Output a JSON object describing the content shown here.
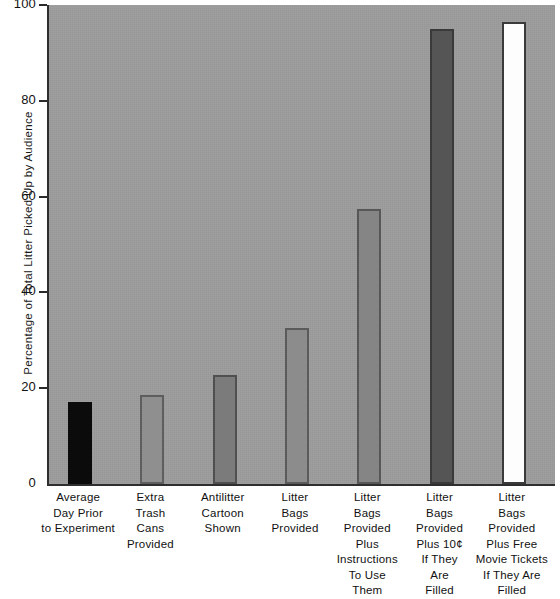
{
  "chart_data": {
    "type": "bar",
    "title": "",
    "subtitle": "",
    "xlabel": "",
    "ylabel": "Percentage of Total Litter Picked Up by Audience",
    "ylim": [
      0,
      100
    ],
    "yticks": [
      0,
      20,
      40,
      60,
      80,
      100
    ],
    "ytick_labels": [
      "0",
      "20",
      "40",
      "60",
      "80",
      "100"
    ],
    "grid": false,
    "legend": "none",
    "categories": [
      "Average Day Prior to Experiment",
      "Extra Trash Cans Provided",
      "Antilitter Cartoon Shown",
      "Litter Bags Provided",
      "Litter Bags Provided Plus Instructions To Use Them",
      "Litter Bags Provided Plus 10¢ If They Are Filled",
      "Litter Bags Provided Plus Free Movie Tickets If They Are Filled"
    ],
    "category_label_lines": [
      [
        "Average",
        "Day Prior",
        "to Experiment"
      ],
      [
        "Extra",
        "Trash",
        "Cans",
        "Provided"
      ],
      [
        "Antilitter",
        "Cartoon",
        "Shown"
      ],
      [
        "Litter",
        "Bags",
        "Provided"
      ],
      [
        "Litter",
        "Bags",
        "Provided",
        "Plus",
        "Instructions",
        "To Use",
        "Them"
      ],
      [
        "Litter",
        "Bags",
        "Provided",
        "Plus 10¢",
        "If They",
        "Are",
        "Filled"
      ],
      [
        "Litter",
        "Bags",
        "Provided",
        "Plus Free",
        "Movie Tickets",
        "If They Are",
        "Filled"
      ]
    ],
    "values": [
      17.2,
      18.5,
      22.7,
      32.5,
      57.5,
      95.0,
      96.5
    ],
    "bar_colors": [
      "#0b0b0b",
      "#8f8f8f",
      "#7b7b7b",
      "#8c8c8c",
      "#858585",
      "#555555",
      "#fdfdfd"
    ],
    "bar_border_colors": [
      "#0b0b0b",
      "#5e5e5e",
      "#4f4f4f",
      "#5b5b5b",
      "#575757",
      "#3a3a3a",
      "#3a3a3a"
    ]
  },
  "colors": {
    "plot_background": "#9d9d9d",
    "page_background": "#ffffff",
    "axis": "#2e2e2e",
    "text": "#111111"
  }
}
